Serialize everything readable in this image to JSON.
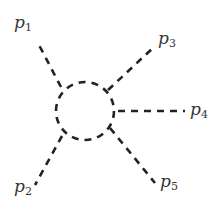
{
  "diagram": {
    "type": "feynman-loop",
    "loop": {
      "shape": "dashed-circle",
      "cx": 85,
      "cy": 111,
      "r": 29
    },
    "legs": [
      {
        "id": "p1",
        "symbol": "p",
        "index": "1",
        "from": [
          61,
          87
        ],
        "to": [
          39,
          45
        ],
        "label_pos": [
          14,
          14
        ]
      },
      {
        "id": "p2",
        "symbol": "p",
        "index": "2",
        "from": [
          62,
          136
        ],
        "to": [
          35,
          185
        ],
        "label_pos": [
          14,
          178
        ]
      },
      {
        "id": "p3",
        "symbol": "p",
        "index": "3",
        "from": [
          108,
          90
        ],
        "to": [
          155,
          46
        ],
        "label_pos": [
          158,
          30
        ]
      },
      {
        "id": "p4",
        "symbol": "p",
        "index": "4",
        "from": [
          118,
          111
        ],
        "to": [
          185,
          111
        ],
        "label_pos": [
          190,
          101
        ]
      },
      {
        "id": "p5",
        "symbol": "p",
        "index": "5",
        "from": [
          110,
          128
        ],
        "to": [
          155,
          183
        ],
        "label_pos": [
          160,
          173
        ]
      }
    ]
  }
}
